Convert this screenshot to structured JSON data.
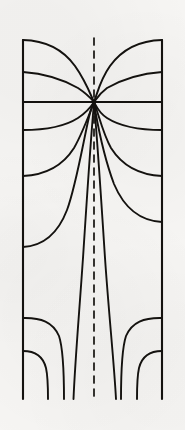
{
  "figure": {
    "kind": "line-diagram",
    "background_color": "#f6f5f3",
    "ink_color": "#14120f",
    "canvas": {
      "width": 185,
      "height": 430
    }
  },
  "chart_data": {
    "type": "line",
    "subtitle": "",
    "xlabel": "",
    "ylabel": "",
    "xlim": [
      22,
      163
    ],
    "ylim": [
      36,
      400
    ],
    "grid": false,
    "legend_position": "none",
    "axis_labels_visible": false,
    "tick_labels_visible": false,
    "symmetry": "mirror about vertical centerline",
    "centerline": {
      "name": "axis-of-symmetry",
      "style": "dashed",
      "x": 94,
      "y_start": 38,
      "y_end": 400,
      "dash_pattern": "7 6",
      "stroke_width": 1.7
    },
    "saddle_node": {
      "label": "stagnation point",
      "x": 94,
      "y": 102
    },
    "frame_rails": [
      {
        "name": "left-rail",
        "x": 23,
        "y_start": 40,
        "y_end": 399
      },
      {
        "name": "right-rail",
        "x": 162,
        "y_start": 40,
        "y_end": 399
      }
    ],
    "series": [
      {
        "name": "separatrix-horizontal",
        "note": "horizontal line through saddle node, full width",
        "values": [
          [
            23,
            102
          ],
          [
            94,
            102
          ],
          [
            162,
            102
          ]
        ]
      },
      {
        "name": "upper-lobe-left",
        "note": "arc from top-left corner down to node",
        "values": [
          [
            23,
            40
          ],
          [
            45,
            42
          ],
          [
            66,
            54
          ],
          [
            80,
            74
          ],
          [
            94,
            102
          ]
        ]
      },
      {
        "name": "upper-lobe-right",
        "note": "arc from top-right corner down to node",
        "values": [
          [
            162,
            40
          ],
          [
            140,
            42
          ],
          [
            119,
            54
          ],
          [
            105,
            74
          ],
          [
            94,
            102
          ]
        ]
      },
      {
        "name": "upper-chord-left",
        "note": "near-straight chord from left rail to node",
        "values": [
          [
            23,
            72
          ],
          [
            52,
            75
          ],
          [
            75,
            86
          ],
          [
            94,
            102
          ]
        ]
      },
      {
        "name": "upper-chord-right",
        "note": "near-straight chord from right rail to node",
        "values": [
          [
            162,
            72
          ],
          [
            133,
            75
          ],
          [
            110,
            86
          ],
          [
            94,
            102
          ]
        ]
      },
      {
        "name": "lower-fan-1-left",
        "values": [
          [
            23,
            130
          ],
          [
            48,
            129
          ],
          [
            70,
            122
          ],
          [
            85,
            112
          ],
          [
            94,
            102
          ]
        ]
      },
      {
        "name": "lower-fan-1-right",
        "values": [
          [
            162,
            130
          ],
          [
            137,
            129
          ],
          [
            115,
            122
          ],
          [
            103,
            112
          ],
          [
            94,
            102
          ]
        ]
      },
      {
        "name": "lower-fan-2-left",
        "values": [
          [
            23,
            176
          ],
          [
            47,
            173
          ],
          [
            66,
            161
          ],
          [
            80,
            139
          ],
          [
            89,
            118
          ],
          [
            94,
            102
          ]
        ]
      },
      {
        "name": "lower-fan-2-right",
        "values": [
          [
            162,
            176
          ],
          [
            138,
            173
          ],
          [
            119,
            161
          ],
          [
            105,
            139
          ],
          [
            99,
            118
          ],
          [
            94,
            102
          ]
        ]
      },
      {
        "name": "lower-fan-3-left",
        "note": "long asymptotic branch to left rail low down",
        "values": [
          [
            23,
            247
          ],
          [
            44,
            244
          ],
          [
            62,
            228
          ],
          [
            75,
            196
          ],
          [
            84,
            155
          ],
          [
            90,
            124
          ],
          [
            94,
            102
          ]
        ]
      },
      {
        "name": "lower-fan-3-right",
        "values": [
          [
            162,
            222
          ],
          [
            140,
            219
          ],
          [
            121,
            202
          ],
          [
            108,
            172
          ],
          [
            99,
            138
          ],
          [
            95,
            115
          ],
          [
            94,
            102
          ]
        ]
      },
      {
        "name": "tail-left-inner",
        "note": "inner near-vertical tail descending to bottom",
        "values": [
          [
            94,
            104
          ],
          [
            90,
            150
          ],
          [
            86,
            212
          ],
          [
            80,
            290
          ],
          [
            75,
            350
          ],
          [
            72,
            399
          ]
        ]
      },
      {
        "name": "tail-right-inner",
        "values": [
          [
            94,
            104
          ],
          [
            98,
            150
          ],
          [
            102,
            212
          ],
          [
            108,
            290
          ],
          [
            114,
            350
          ],
          [
            118,
            399
          ]
        ]
      },
      {
        "name": "bottom-shoulder-left",
        "note": "curve from left rail bending down to bottom",
        "values": [
          [
            23,
            318
          ],
          [
            42,
            317
          ],
          [
            55,
            324
          ],
          [
            62,
            342
          ],
          [
            64,
            370
          ],
          [
            64,
            399
          ]
        ]
      },
      {
        "name": "bottom-shoulder-right",
        "values": [
          [
            162,
            318
          ],
          [
            143,
            317
          ],
          [
            130,
            324
          ],
          [
            123,
            342
          ],
          [
            121,
            370
          ],
          [
            121,
            399
          ]
        ]
      },
      {
        "name": "bottom-corner-left",
        "note": "short curve near bottom-left corner",
        "values": [
          [
            23,
            351
          ],
          [
            36,
            352
          ],
          [
            44,
            362
          ],
          [
            47,
            380
          ],
          [
            47,
            399
          ]
        ]
      },
      {
        "name": "bottom-corner-right",
        "values": [
          [
            162,
            351
          ],
          [
            149,
            352
          ],
          [
            141,
            362
          ],
          [
            138,
            380
          ],
          [
            138,
            399
          ]
        ]
      }
    ],
    "annotations": []
  }
}
